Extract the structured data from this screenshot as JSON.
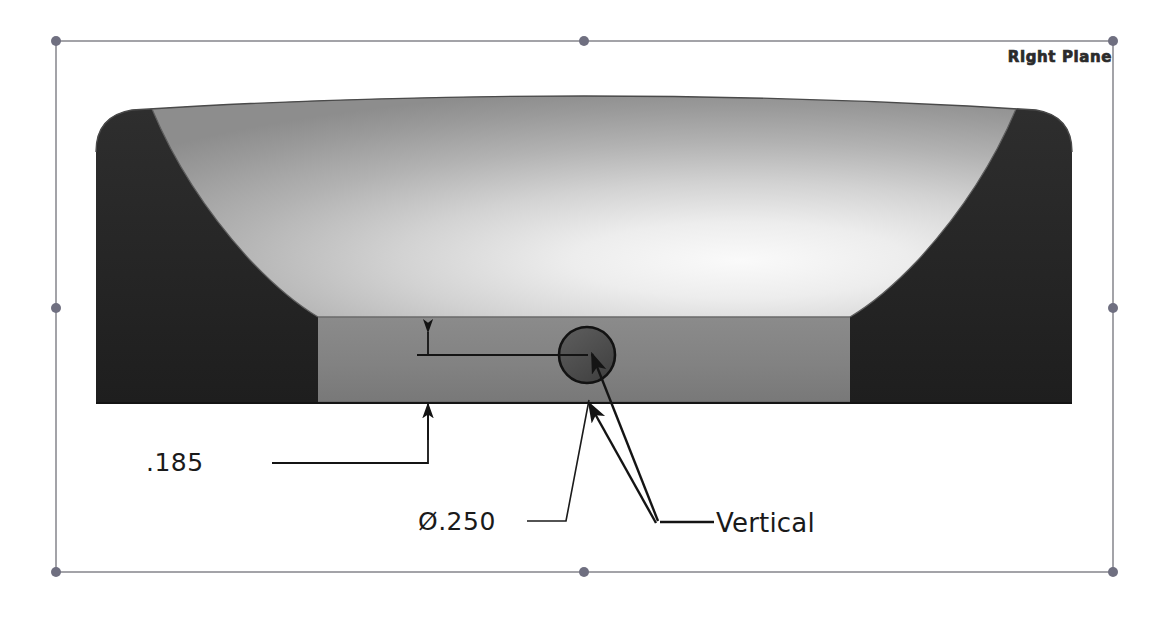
{
  "view": {
    "background_color": "#ffffff",
    "width": 1168,
    "height": 628
  },
  "sketch_plane": {
    "label": "Right Plane",
    "border_color": "#8a8a8a",
    "point_color": "#7a7a8a",
    "rect": {
      "left": 56,
      "top": 41,
      "right": 1113,
      "bottom": 572
    },
    "points": [
      {
        "name": "corner-top-left",
        "x": 56,
        "y": 41
      },
      {
        "name": "midpoint-top",
        "x": 584,
        "y": 41
      },
      {
        "name": "corner-top-right",
        "x": 1113,
        "y": 41
      },
      {
        "name": "midpoint-left",
        "x": 56,
        "y": 308
      },
      {
        "name": "midpoint-right",
        "x": 1113,
        "y": 308
      },
      {
        "name": "corner-bottom-left",
        "x": 56,
        "y": 572
      },
      {
        "name": "midpoint-bottom",
        "x": 584,
        "y": 572
      },
      {
        "name": "corner-bottom-right",
        "x": 1113,
        "y": 572
      }
    ]
  },
  "model": {
    "name": "shaded-solid-body",
    "colors": {
      "top_surface_light": "#f4f4f4",
      "top_surface_mid": "#9b9b9b",
      "top_surface_dark": "#878787",
      "side_dark": "#262626",
      "middle_band": "#808080",
      "middle_band_shadow": "#6e6e6e",
      "outline": "#1f1f1f",
      "hole_fill": "#4d4d4d",
      "hole_outline": "#111111"
    },
    "bounds": {
      "left": 96,
      "top": 106,
      "right": 1072,
      "bottom": 403
    },
    "band_top_y": 318,
    "corner_radius": 36
  },
  "hole": {
    "name": "through-hole",
    "center_x": 587,
    "center_y": 355,
    "radius": 28
  },
  "dimensions": [
    {
      "id": "dim-185",
      "value": ".185",
      "type": "linear-offset",
      "text_x": 146,
      "text_y": 448,
      "leader": {
        "shoulder_x": 272,
        "shoulder_y": 463,
        "elbow_x": 428,
        "elbow_y": 463,
        "arrow_x": 428,
        "arrow_y": 405
      }
    },
    {
      "id": "dim-250",
      "value": "Ø.250",
      "type": "diameter",
      "text_x": 418,
      "text_y": 507,
      "leader": {
        "shoulder_x": 527,
        "shoulder_y": 521,
        "elbow_x": 566,
        "elbow_y": 521,
        "arrow_x": 576,
        "arrow_y": 399
      }
    }
  ],
  "relations": [
    {
      "id": "relation-vertical",
      "label": "Vertical",
      "text_x": 716,
      "text_y": 508,
      "shoulder": {
        "x": 660,
        "y": 522,
        "x2": 712,
        "y2": 522
      },
      "arrows": [
        {
          "to_x": 590,
          "to_y": 352
        },
        {
          "to_x": 588,
          "to_y": 401
        }
      ]
    }
  ],
  "dimension_line": {
    "name": "horizontal-dimension-line",
    "from_x": 417,
    "to_x": 588,
    "y": 355,
    "tick_x": 428
  }
}
